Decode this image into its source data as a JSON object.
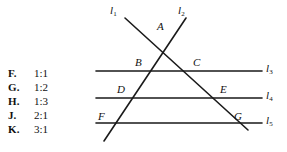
{
  "question": {
    "choices": [
      {
        "letter": "F.",
        "value": "1:1"
      },
      {
        "letter": "G.",
        "value": "1:2"
      },
      {
        "letter": "H.",
        "value": "1:3"
      },
      {
        "letter": "J.",
        "value": "2:1"
      },
      {
        "letter": "K.",
        "value": "3:1"
      }
    ]
  },
  "figure": {
    "stroke_color": "#1a1a1a",
    "point_labels": [
      {
        "id": "A",
        "text": "A",
        "x": 157,
        "y": 20
      },
      {
        "id": "B",
        "text": "B",
        "x": 135,
        "y": 56
      },
      {
        "id": "C",
        "text": "C",
        "x": 193,
        "y": 56
      },
      {
        "id": "D",
        "text": "D",
        "x": 117,
        "y": 83
      },
      {
        "id": "E",
        "text": "E",
        "x": 220,
        "y": 83
      },
      {
        "id": "F",
        "text": "F",
        "x": 98,
        "y": 110
      },
      {
        "id": "G",
        "text": "G",
        "x": 234,
        "y": 110
      }
    ],
    "line_labels": [
      {
        "id": "l1",
        "base": "l",
        "sub": "1",
        "x": 110,
        "y": 4
      },
      {
        "id": "l2",
        "base": "l",
        "sub": "2",
        "x": 178,
        "y": 4
      },
      {
        "id": "l3",
        "base": "l",
        "sub": "3",
        "x": 266,
        "y": 62
      },
      {
        "id": "l4",
        "base": "l",
        "sub": "4",
        "x": 266,
        "y": 89
      },
      {
        "id": "l5",
        "base": "l",
        "sub": "5",
        "x": 266,
        "y": 114
      }
    ],
    "transversal_1": {
      "x1": 125,
      "y1": 18,
      "x2": 248,
      "y2": 130
    },
    "transversal_2": {
      "x1": 186,
      "y1": 18,
      "x2": 104,
      "y2": 141
    },
    "horizontal_3": {
      "x1": 96,
      "y1": 71,
      "x2": 262,
      "y2": 71
    },
    "horizontal_4": {
      "x1": 96,
      "y1": 98,
      "x2": 262,
      "y2": 98
    },
    "horizontal_5": {
      "x1": 96,
      "y1": 123,
      "x2": 262,
      "y2": 123
    }
  }
}
